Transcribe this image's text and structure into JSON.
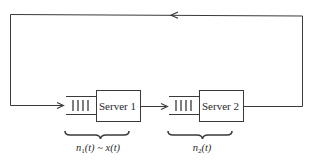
{
  "diagram": {
    "type": "closed tandem queueing network",
    "colors": {
      "stroke": "#3a3a3a",
      "text": "#2a2a2a",
      "background": "#ffffff"
    },
    "nodes": [
      {
        "id": "server1",
        "label": "Server 1",
        "queue_bars": 4
      },
      {
        "id": "server2",
        "label": "Server 2",
        "queue_bars": 4
      }
    ],
    "edges": [
      {
        "from": "server1",
        "to": "server2",
        "direction": "right"
      },
      {
        "from": "server2",
        "to": "server1",
        "route": "feedback loop over top",
        "direction": "left"
      }
    ],
    "annotations": {
      "queue1": {
        "var": "n",
        "sub": "1",
        "arg": "(t)",
        "rel": " ~ ",
        "rhs": "x(t)"
      },
      "queue2": {
        "var": "n",
        "sub": "2",
        "arg": "(t)"
      }
    }
  }
}
